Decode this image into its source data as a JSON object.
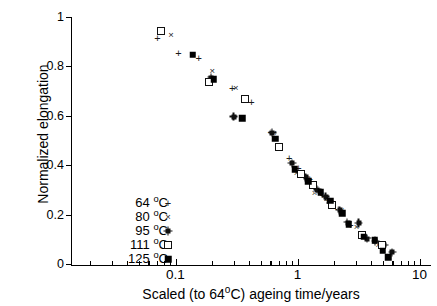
{
  "chart_data": {
    "type": "scatter",
    "title": "",
    "xlabel": "Scaled (to 64°C) ageing time/years",
    "ylabel": "Normalized elongation",
    "xscale": "log",
    "yscale": "linear",
    "xlim": [
      0.04,
      10
    ],
    "ylim": [
      0,
      1
    ],
    "grid": false,
    "legend_position": "lower-left",
    "xticks": [
      "0.1",
      "1",
      "10"
    ],
    "xtick_values": [
      0.1,
      1,
      10
    ],
    "yticks": [
      "0",
      "0.2",
      "0.4",
      "0.6",
      "0.8",
      "1"
    ],
    "ytick_values": [
      0,
      0.2,
      0.4,
      0.6,
      0.8,
      1
    ],
    "series": [
      {
        "name": "64 °C",
        "marker": "plus",
        "points": [
          [
            0.071,
            0.917
          ],
          [
            0.106,
            0.856
          ],
          [
            0.155,
            0.838
          ],
          [
            0.292,
            0.715
          ],
          [
            0.42,
            0.657
          ],
          [
            0.604,
            0.536
          ],
          [
            0.855,
            0.432
          ],
          [
            1.02,
            0.392
          ],
          [
            1.26,
            0.345
          ],
          [
            1.48,
            0.307
          ],
          [
            1.62,
            0.283
          ],
          [
            1.82,
            0.262
          ],
          [
            2.16,
            0.225
          ],
          [
            2.72,
            0.158
          ]
        ]
      },
      {
        "name": "80 °C",
        "marker": "cross",
        "points": [
          [
            0.092,
            0.93
          ],
          [
            0.2,
            0.783
          ],
          [
            0.312,
            0.713
          ],
          [
            0.64,
            0.534
          ],
          [
            0.98,
            0.37
          ],
          [
            1.38,
            0.291
          ],
          [
            1.72,
            0.264
          ],
          [
            1.95,
            0.235
          ],
          [
            2.3,
            0.222
          ],
          [
            3.05,
            0.153
          ],
          [
            3.6,
            0.11
          ],
          [
            4.6,
            0.08
          ],
          [
            5.9,
            0.055
          ]
        ]
      },
      {
        "name": "95 °C",
        "marker": "star",
        "points": [
          [
            0.196,
            0.757
          ],
          [
            0.3,
            0.598
          ],
          [
            0.62,
            0.533
          ],
          [
            0.9,
            0.41
          ],
          [
            1.17,
            0.353
          ],
          [
            1.45,
            0.303
          ],
          [
            1.7,
            0.274
          ],
          [
            1.88,
            0.248
          ],
          [
            2.22,
            0.22
          ],
          [
            2.57,
            0.17
          ],
          [
            3.18,
            0.168
          ],
          [
            3.72,
            0.105
          ],
          [
            4.35,
            0.095
          ],
          [
            5.15,
            0.078
          ],
          [
            6.0,
            0.05
          ]
        ]
      },
      {
        "name": "111 °C",
        "marker": "open-square",
        "points": [
          [
            0.076,
            0.944
          ],
          [
            0.188,
            0.74
          ],
          [
            0.368,
            0.672
          ],
          [
            0.7,
            0.475
          ],
          [
            1.06,
            0.368
          ],
          [
            1.33,
            0.32
          ],
          [
            1.92,
            0.241
          ],
          [
            3.38,
            0.12
          ],
          [
            4.95,
            0.08
          ]
        ]
      },
      {
        "name": "125 °C",
        "marker": "filled-square",
        "points": [
          [
            0.138,
            0.85
          ],
          [
            0.205,
            0.751
          ],
          [
            0.352,
            0.593
          ],
          [
            0.66,
            0.51
          ],
          [
            0.945,
            0.385
          ],
          [
            1.22,
            0.337
          ],
          [
            1.55,
            0.293
          ],
          [
            1.85,
            0.259
          ],
          [
            2.33,
            0.208
          ],
          [
            2.62,
            0.163
          ],
          [
            3.48,
            0.113
          ],
          [
            4.28,
            0.098
          ],
          [
            4.98,
            0.055
          ],
          [
            5.55,
            0.03
          ]
        ]
      }
    ]
  },
  "legend": {
    "entries": [
      {
        "label": "64 °C",
        "marker": "plus"
      },
      {
        "label": "80 °C",
        "marker": "cross"
      },
      {
        "label": "95 °C",
        "marker": "star"
      },
      {
        "label": "111 °C",
        "marker": "open-square"
      },
      {
        "label": "125 °C",
        "marker": "filled-square"
      }
    ]
  },
  "axes": {
    "x_title_parts": {
      "pre": "Scaled (to 64",
      "deg": "o",
      "post": "C) ageing time/years"
    },
    "y_title": "Normalized elongation"
  },
  "colors": {
    "axis": "#000000",
    "marker": "#111111",
    "background": "#ffffff"
  }
}
